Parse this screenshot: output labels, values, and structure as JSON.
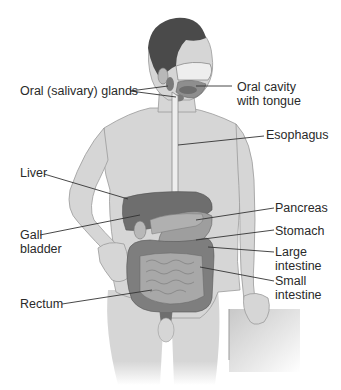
{
  "diagram": {
    "type": "anatomical-illustration",
    "colors": {
      "background": "#ffffff",
      "skin": "#d6d6d6",
      "skin_outline": "#9a9a9a",
      "hair": "#4a4a4a",
      "organ_dark": "#6e6e6e",
      "organ_mid": "#8e8e8e",
      "organ_light": "#b8b8b8",
      "leader_line": "#333333",
      "text": "#2a2a2a"
    },
    "labels": [
      {
        "id": "oral-salivary-glands",
        "lines": [
          "Oral (salivary) glands"
        ],
        "side": "left"
      },
      {
        "id": "oral-cavity-with-tongue",
        "lines": [
          "Oral cavity",
          "with tongue"
        ],
        "side": "right"
      },
      {
        "id": "esophagus",
        "lines": [
          "Esophagus"
        ],
        "side": "right"
      },
      {
        "id": "liver",
        "lines": [
          "Liver"
        ],
        "side": "left"
      },
      {
        "id": "pancreas",
        "lines": [
          "Pancreas"
        ],
        "side": "right"
      },
      {
        "id": "gall-bladder",
        "lines": [
          "Gall",
          "bladder"
        ],
        "side": "left"
      },
      {
        "id": "stomach",
        "lines": [
          "Stomach"
        ],
        "side": "right"
      },
      {
        "id": "large-intestine",
        "lines": [
          "Large",
          "intestine"
        ],
        "side": "right"
      },
      {
        "id": "small-intestine",
        "lines": [
          "Small",
          "intestine"
        ],
        "side": "right"
      },
      {
        "id": "rectum",
        "lines": [
          "Rectum"
        ],
        "side": "left"
      }
    ]
  }
}
